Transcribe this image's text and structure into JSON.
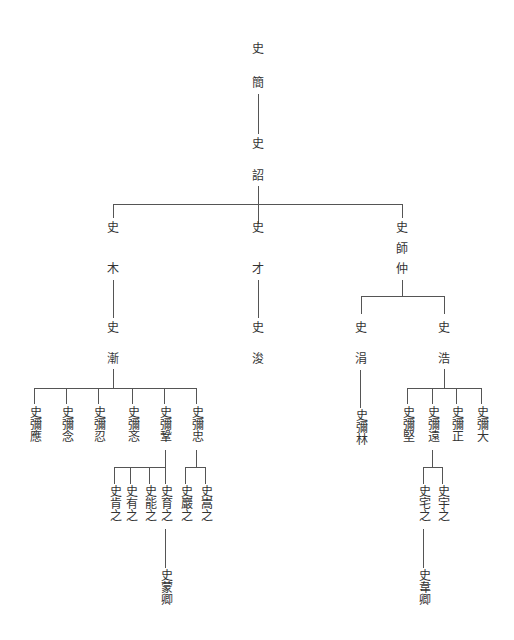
{
  "diagram": {
    "type": "genealogy-tree",
    "root": {
      "surname": "史",
      "given": "簡",
      "child": {
        "surname": "史",
        "given": "詔",
        "children": [
          {
            "surname": "史",
            "given": "木",
            "child": {
              "surname": "史",
              "given": "漸",
              "children": [
                {
                  "name": "史彌應"
                },
                {
                  "name": "史彌念"
                },
                {
                  "name": "史彌忍"
                },
                {
                  "name": "史彌忞"
                },
                {
                  "name": "史彌鞏",
                  "children": [
                    {
                      "name": "史肯之"
                    },
                    {
                      "name": "史有之"
                    },
                    {
                      "name": "史能之"
                    },
                    {
                      "name": "史育之",
                      "child": {
                        "name": "史蒙卿"
                      }
                    }
                  ]
                },
                {
                  "name": "史彌忠",
                  "children": [
                    {
                      "name": "史巖之"
                    },
                    {
                      "name": "史嵩之"
                    }
                  ]
                }
              ]
            }
          },
          {
            "surname": "史",
            "given": "才",
            "child": {
              "surname": "史",
              "given": "浚"
            }
          },
          {
            "surname": "史",
            "given": "師仲",
            "children": [
              {
                "surname": "史",
                "given": "涓",
                "child": {
                  "name": "史彌林"
                }
              },
              {
                "surname": "史",
                "given": "浩",
                "children": [
                  {
                    "name": "史彌堅"
                  },
                  {
                    "name": "史彌遠",
                    "children": [
                      {
                        "name": "史宅之",
                        "child": {
                          "name": "史韋卿"
                        }
                      },
                      {
                        "name": "史宇之"
                      }
                    ]
                  },
                  {
                    "name": "史彌正"
                  },
                  {
                    "name": "史彌大"
                  }
                ]
              }
            ]
          }
        ]
      }
    }
  },
  "labels": {
    "jian_surname": "史",
    "jian_given": "簡",
    "zhao_surname": "史",
    "zhao_given": "詔",
    "mu_surname": "史",
    "mu_given": "木",
    "cai_surname": "史",
    "cai_given": "才",
    "shizhong_surname": "史",
    "shizhong_given1": "師",
    "shizhong_given2": "仲",
    "jian2_surname": "史",
    "jian2_given": "漸",
    "jun_surname": "史",
    "jun_given": "浚",
    "juan_surname": "史",
    "juan_given": "涓",
    "hao_surname": "史",
    "hao_given": "浩",
    "miying": "史彌應",
    "minian": "史彌念",
    "miren": "史彌忍",
    "mimin": "史彌忞",
    "migong": "史彌鞏",
    "mizhong": "史彌忠",
    "kenzhi": "史肯之",
    "youzhi": "史有之",
    "nengzhi": "史能之",
    "yuzhi": "史育之",
    "yanzhi": "史巖之",
    "songzhi": "史嵩之",
    "mengqing": "史蒙卿",
    "milin": "史彌林",
    "mijian": "史彌堅",
    "miyuan": "史彌遠",
    "mizheng": "史彌正",
    "mida": "史彌大",
    "zhaizhi": "史宅之",
    "yuzhi2": "史宇之",
    "weiqing": "史韋卿"
  },
  "colors": {
    "line": "#555555",
    "text": "#333333",
    "background": "#ffffff"
  }
}
